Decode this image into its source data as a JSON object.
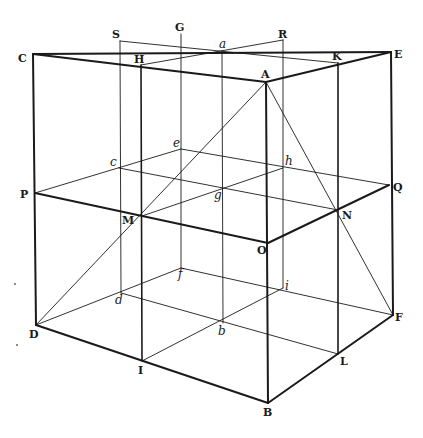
{
  "figure": {
    "stroke_color": "#1a1a1a",
    "background": "#ffffff"
  },
  "points": {
    "C": {
      "x": 33,
      "y": 54,
      "label": "C",
      "lx": 18,
      "ly": 62,
      "style": "upper"
    },
    "S": {
      "x": 120,
      "y": 41,
      "label": "S",
      "lx": 112,
      "ly": 38,
      "style": "upper"
    },
    "G": {
      "x": 181,
      "y": 34,
      "label": "G",
      "lx": 175,
      "ly": 31,
      "style": "upper"
    },
    "R": {
      "x": 283,
      "y": 40,
      "label": "R",
      "lx": 278,
      "ly": 38,
      "style": "upper"
    },
    "E": {
      "x": 391,
      "y": 52,
      "label": "E",
      "lx": 394,
      "ly": 58,
      "style": "upper"
    },
    "H": {
      "x": 141,
      "y": 65,
      "label": "H",
      "lx": 134,
      "ly": 63,
      "style": "upper"
    },
    "a": {
      "x": 222,
      "y": 51,
      "label": "a",
      "lx": 219,
      "ly": 48,
      "style": "lower"
    },
    "K": {
      "x": 338,
      "y": 63,
      "label": "K",
      "lx": 332,
      "ly": 60,
      "style": "upper"
    },
    "A": {
      "x": 266,
      "y": 82,
      "label": "A",
      "lx": 261,
      "ly": 78,
      "style": "upper"
    },
    "e": {
      "x": 181,
      "y": 149,
      "label": "e",
      "lx": 173,
      "ly": 147,
      "style": "lower"
    },
    "c": {
      "x": 119,
      "y": 168,
      "label": "c",
      "lx": 110,
      "ly": 166,
      "style": "lower"
    },
    "h": {
      "x": 283,
      "y": 168,
      "label": "h",
      "lx": 285,
      "ly": 165,
      "style": "lower"
    },
    "P": {
      "x": 35,
      "y": 193,
      "label": "P",
      "lx": 20,
      "ly": 198,
      "style": "upper"
    },
    "Q": {
      "x": 389,
      "y": 185,
      "label": "Q",
      "lx": 393,
      "ly": 191,
      "style": "upper"
    },
    "g": {
      "x": 224,
      "y": 187,
      "label": "g",
      "lx": 214,
      "ly": 199,
      "style": "lower"
    },
    "M": {
      "x": 142,
      "y": 216,
      "label": "M",
      "lx": 122,
      "ly": 224,
      "style": "upper"
    },
    "N": {
      "x": 338,
      "y": 210,
      "label": "N",
      "lx": 342,
      "ly": 219,
      "style": "upper"
    },
    "O": {
      "x": 268,
      "y": 243,
      "label": "O",
      "lx": 257,
      "ly": 254,
      "style": "upper"
    },
    "f": {
      "x": 181,
      "y": 268,
      "label": "f",
      "lx": 178,
      "ly": 278,
      "style": "lower"
    },
    "i": {
      "x": 283,
      "y": 288,
      "label": "i",
      "lx": 285,
      "ly": 290,
      "style": "lower"
    },
    "d": {
      "x": 121,
      "y": 293,
      "label": "d",
      "lx": 115,
      "ly": 304,
      "style": "lower"
    },
    "D": {
      "x": 36,
      "y": 325,
      "label": "D",
      "lx": 29,
      "ly": 338,
      "style": "upper"
    },
    "F": {
      "x": 393,
      "y": 315,
      "label": "F",
      "lx": 395,
      "ly": 321,
      "style": "upper"
    },
    "b": {
      "x": 223,
      "y": 323,
      "label": "b",
      "lx": 218,
      "ly": 335,
      "style": "lower"
    },
    "I": {
      "x": 142,
      "y": 361,
      "label": "I",
      "lx": 138,
      "ly": 374,
      "style": "upper"
    },
    "L": {
      "x": 338,
      "y": 354,
      "label": "L",
      "lx": 340,
      "ly": 365,
      "style": "upper"
    },
    "B": {
      "x": 268,
      "y": 403,
      "label": "B",
      "lx": 263,
      "ly": 416,
      "style": "upper"
    }
  },
  "segments": [
    {
      "from": "C",
      "to": "E",
      "weight": "thick"
    },
    {
      "from": "C",
      "to": "A",
      "weight": "thick"
    },
    {
      "from": "A",
      "to": "E",
      "weight": "thick"
    },
    {
      "from": "C",
      "to": "D",
      "weight": "thick"
    },
    {
      "from": "A",
      "to": "B",
      "weight": "thick"
    },
    {
      "from": "E",
      "to": "F",
      "weight": "thick"
    },
    {
      "from": "D",
      "to": "B",
      "weight": "thick"
    },
    {
      "from": "B",
      "to": "F",
      "weight": "thick"
    },
    {
      "from": "P",
      "to": "O",
      "weight": "thick"
    },
    {
      "from": "O",
      "to": "Q",
      "weight": "thick"
    },
    {
      "from": "H",
      "to": "I",
      "weight": "medium"
    },
    {
      "from": "K",
      "to": "L",
      "weight": "medium"
    },
    {
      "from": "S",
      "to": "K",
      "weight": "thin"
    },
    {
      "from": "H",
      "to": "R",
      "weight": "thin"
    },
    {
      "from": "S",
      "to": "d",
      "weight": "thin"
    },
    {
      "from": "G",
      "to": "f",
      "weight": "thin"
    },
    {
      "from": "R",
      "to": "i",
      "weight": "thin"
    },
    {
      "from": "a",
      "to": "b",
      "weight": "thin"
    },
    {
      "from": "P",
      "to": "e",
      "weight": "thin"
    },
    {
      "from": "e",
      "to": "Q",
      "weight": "thin"
    },
    {
      "from": "c",
      "to": "N",
      "weight": "thin"
    },
    {
      "from": "M",
      "to": "h",
      "weight": "thin"
    },
    {
      "from": "D",
      "to": "f",
      "weight": "thin"
    },
    {
      "from": "f",
      "to": "F",
      "weight": "thin"
    },
    {
      "from": "d",
      "to": "L",
      "weight": "thin"
    },
    {
      "from": "I",
      "to": "i",
      "weight": "thin"
    },
    {
      "from": "A",
      "to": "D",
      "weight": "thin"
    },
    {
      "from": "A",
      "to": "F",
      "weight": "thin"
    }
  ],
  "stray_marks": [
    {
      "x": 15,
      "y": 284
    },
    {
      "x": 17,
      "y": 345
    }
  ]
}
